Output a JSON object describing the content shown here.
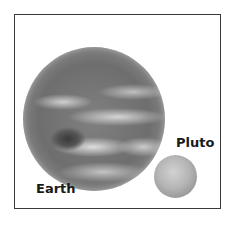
{
  "diagram": {
    "type": "size comparison",
    "objects": [
      {
        "name": "Earth",
        "label": "Earth",
        "relative_size": "large"
      },
      {
        "name": "Pluto",
        "label": "Pluto",
        "relative_size": "small"
      }
    ]
  },
  "labels": {
    "earth": "Earth",
    "pluto": "Pluto"
  },
  "colors": {
    "frame": "#3a3a3a",
    "text": "#1a1a1a",
    "background": "#ffffff"
  }
}
